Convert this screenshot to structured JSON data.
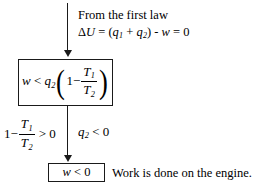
{
  "diagram": {
    "background_color": "#ffffff",
    "line_color": "#1a1a1a",
    "header": {
      "line1": "From the first law",
      "line2_parts": {
        "delta": "Δ",
        "u": "U",
        "eq1": " = (",
        "q": "q",
        "sub1": "1",
        "plus": " + ",
        "q2": "q",
        "sub2": "2",
        "close": ") - ",
        "w": "w",
        "eq2": " = 0"
      },
      "line2_plain": "ΔU = (q1 + q2) - w = 0"
    },
    "main_box": {
      "expression_plain": "w < q2 (1 - T1/T2)",
      "w": "w",
      "lt": " < ",
      "q": "q",
      "q_sub": "2",
      "paren_open": "(",
      "one": "1",
      "minus": "−",
      "num_T": "T",
      "num_sub": "1",
      "den_T": "T",
      "den_sub": "2",
      "paren_close": ")"
    },
    "left_condition": {
      "expression_plain": "1 - T1/T2 > 0",
      "one": "1",
      "minus": "−",
      "num_T": "T",
      "num_sub": "1",
      "den_T": "T",
      "den_sub": "2",
      "gt": " > 0"
    },
    "right_condition": {
      "expression_plain": "q2 < 0",
      "q": "q",
      "q_sub": "2",
      "lt": " < 0"
    },
    "result_box": {
      "expression_plain": "w < 0",
      "w": "w",
      "lt": " < 0"
    },
    "result_text": "Work is done on the engine.",
    "arrows": [
      {
        "name": "arrow-top",
        "from": "first law statement",
        "to": "main box"
      },
      {
        "name": "arrow-bottom",
        "from": "main box",
        "to": "result box"
      }
    ]
  }
}
